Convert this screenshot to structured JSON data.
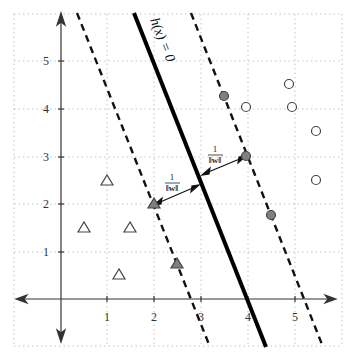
{
  "diagram": {
    "type": "svm-max-margin",
    "axes": {
      "x_ticks": [
        "1",
        "2",
        "3",
        "4",
        "5"
      ],
      "y_ticks": [
        "1",
        "2",
        "3",
        "4",
        "5"
      ]
    },
    "labels": {
      "hyperplane": "h(x) = 0",
      "margin_numerator": "1",
      "margin_denominator": "‖w‖"
    },
    "circles": [
      {
        "x": 4.5,
        "y": 4.25,
        "support_vector": true
      },
      {
        "x": 4.0,
        "y": 4.0,
        "support_vector": false
      },
      {
        "x": 5.0,
        "y": 4.0,
        "support_vector": false
      },
      {
        "x": 4.9,
        "y": 4.5,
        "support_vector": false
      },
      {
        "x": 5.5,
        "y": 3.5,
        "support_vector": false
      },
      {
        "x": 5.5,
        "y": 2.5,
        "support_vector": false
      },
      {
        "x": 4.0,
        "y": 3.0,
        "support_vector": true
      },
      {
        "x": 4.5,
        "y": 1.75,
        "support_vector": true
      }
    ],
    "triangles": [
      {
        "x": 1.0,
        "y": 2.5,
        "support_vector": false
      },
      {
        "x": 0.5,
        "y": 1.5,
        "support_vector": false
      },
      {
        "x": 1.5,
        "y": 1.5,
        "support_vector": false
      },
      {
        "x": 1.25,
        "y": 0.5,
        "support_vector": false
      },
      {
        "x": 2.0,
        "y": 2.0,
        "support_vector": true
      },
      {
        "x": 2.5,
        "y": 0.75,
        "support_vector": true
      }
    ],
    "colors": {
      "support_fill": "#808080",
      "stroke": "#333333",
      "grid": "#bbbbbb"
    }
  }
}
